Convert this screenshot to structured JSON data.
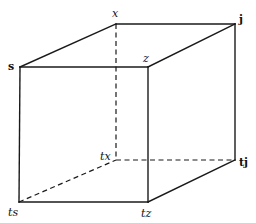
{
  "diagram": {
    "type": "cube",
    "vertices": {
      "x": {
        "label": "x",
        "pos": [
          116,
          24
        ]
      },
      "j": {
        "label": "j",
        "pos": [
          235,
          24
        ]
      },
      "s": {
        "label": "s",
        "pos": [
          20,
          67
        ]
      },
      "z": {
        "label": "z",
        "pos": [
          148,
          67
        ]
      },
      "tx": {
        "label": "tx",
        "pos": [
          116,
          160
        ]
      },
      "tj": {
        "label": "tj",
        "pos": [
          235,
          160
        ]
      },
      "ts": {
        "label": "ts",
        "pos": [
          19,
          202
        ]
      },
      "tz": {
        "label": "tz",
        "pos": [
          148,
          202
        ]
      }
    },
    "solid_edges": [
      [
        "s",
        "x"
      ],
      [
        "x",
        "j"
      ],
      [
        "s",
        "z"
      ],
      [
        "z",
        "j"
      ],
      [
        "s",
        "ts"
      ],
      [
        "z",
        "tz"
      ],
      [
        "j",
        "tj"
      ],
      [
        "ts",
        "tz"
      ],
      [
        "tz",
        "tj"
      ]
    ],
    "dashed_edges": [
      [
        "x",
        "tx"
      ],
      [
        "tx",
        "tj"
      ],
      [
        "ts",
        "tx"
      ]
    ],
    "colors": {
      "line": "#1a1a1a",
      "background": "#ffffff"
    }
  }
}
